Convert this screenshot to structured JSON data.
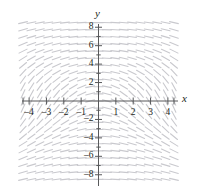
{
  "figure": {
    "kind": "slope-field",
    "background_color": "#ffffff",
    "axis_color": "#58595b",
    "field_color": "#c9c9ce",
    "text_color": "#231f20"
  },
  "labels": {
    "x_axis": "x",
    "y_axis": "y"
  },
  "chart_data": {
    "type": "scatter",
    "subtype": "slope-field",
    "title": "",
    "subtitle": "",
    "xlabel": "x",
    "ylabel": "y",
    "xlim": [
      -4.6,
      4.6
    ],
    "ylim": [
      -8.8,
      8.8
    ],
    "grid": false,
    "legend": null,
    "annotations": [],
    "x_ticks": [
      -4,
      -3,
      -2,
      -1,
      1,
      2,
      3,
      4
    ],
    "x_tick_labels": [
      "–4",
      "–3",
      "–2",
      "–1",
      "1",
      "2",
      "3",
      "4"
    ],
    "y_ticks": [
      8,
      6,
      4,
      2,
      -2,
      -4,
      -6,
      -8
    ],
    "y_tick_labels": [
      "8",
      "6",
      "4",
      "2",
      "–2",
      "–4",
      "–6",
      "–8"
    ],
    "minor_y_ticks": [
      7,
      5,
      3,
      1,
      -1,
      -3,
      -5,
      -7
    ],
    "slope_formula": "dy/dx = -x/(1+y^2/8)",
    "field_x_range": [
      -4.35,
      4.35
    ],
    "field_y_range": [
      -8.5,
      8.5
    ],
    "field_cols": 19,
    "field_rows": 23,
    "segment_length_px": 9,
    "segment_width_px": 1.1
  }
}
